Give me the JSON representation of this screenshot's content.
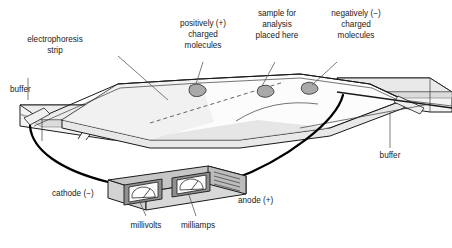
{
  "diagram": {
    "labels": {
      "electrophoresis_strip": [
        "electrophoresis",
        "strip"
      ],
      "buffer_left": "buffer",
      "buffer_right": "buffer",
      "positive_molecules": [
        "positively (+)",
        "charged",
        "molecules"
      ],
      "sample": [
        "sample for",
        "analysis",
        "placed here"
      ],
      "negative_molecules": [
        "negatively (−)",
        "charged",
        "molecules"
      ],
      "cathode": "cathode (−)",
      "anode": "anode (+)",
      "millivolts": "millivolts",
      "milliamps": "milliamps"
    },
    "colors": {
      "outline": "#1a1a1a",
      "leader": "#5a5a5a",
      "text": "#1a1a1a",
      "face_light": "#f2f2f2",
      "face_mid": "#e4e4e4",
      "face_dark": "#cfcfcf",
      "box_body": "#d4d4d4",
      "box_top": "#c2c2c2",
      "molecule": "#a8a8a8",
      "background": "#ffffff",
      "wire": "#000000"
    },
    "molecules": [
      {
        "name": "positively-charged-molecule",
        "cx": 198,
        "cy": 90
      },
      {
        "name": "sample-molecule",
        "cx": 266,
        "cy": 91
      },
      {
        "name": "negatively-charged-molecule",
        "cx": 310,
        "cy": 88
      }
    ],
    "meters": [
      {
        "name": "millivolts-meter",
        "label": "millivolts"
      },
      {
        "name": "milliamps-meter",
        "label": "milliamps"
      }
    ]
  }
}
